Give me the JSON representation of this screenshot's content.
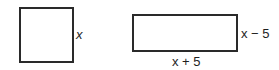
{
  "figure": {
    "square": {
      "side_label": "x"
    },
    "rectangle": {
      "height_label": "x − 5",
      "width_label": "x + 5"
    }
  },
  "colors": {
    "stroke": "#2a2a2a",
    "text": "#1e1e1e",
    "background": "#ffffff"
  }
}
